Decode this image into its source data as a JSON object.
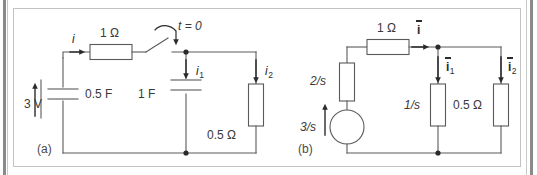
{
  "figure": {
    "type": "circuit-diagram",
    "background_color": "#ffffff",
    "line_color": "#4a4a4a",
    "panels": [
      {
        "id": "a",
        "caption": "(a)",
        "components": [
          {
            "name": "source-3v",
            "label": "3 V",
            "kind": "voltage-source-arrow"
          },
          {
            "name": "resistor-1ohm",
            "label": "1 Ω",
            "kind": "resistor"
          },
          {
            "name": "capacitor-0p5f",
            "label": "0.5 F",
            "kind": "capacitor"
          },
          {
            "name": "capacitor-1f",
            "label": "1 F",
            "kind": "capacitor"
          },
          {
            "name": "resistor-0p5ohm",
            "label": "0.5 Ω",
            "kind": "resistor"
          },
          {
            "name": "switch",
            "label": "t = 0",
            "kind": "switch"
          }
        ],
        "currents": [
          {
            "name": "current-i",
            "base": "i",
            "sub": "",
            "bar": false
          },
          {
            "name": "current-i1",
            "base": "i",
            "sub": "1",
            "bar": false
          },
          {
            "name": "current-i2",
            "base": "i",
            "sub": "2",
            "bar": false
          }
        ]
      },
      {
        "id": "b",
        "caption": "(b)",
        "components": [
          {
            "name": "source-3-over-s",
            "label": "3/s",
            "kind": "voltage-source-circle"
          },
          {
            "name": "impedance-2-over-s",
            "label": "2/s",
            "kind": "impedance"
          },
          {
            "name": "impedance-1ohm",
            "label": "1 Ω",
            "kind": "impedance"
          },
          {
            "name": "impedance-1-over-s",
            "label": "1/s",
            "kind": "impedance"
          },
          {
            "name": "impedance-0p5ohm",
            "label": "0.5 Ω",
            "kind": "impedance"
          }
        ],
        "currents": [
          {
            "name": "current-i-bar",
            "base": "i",
            "sub": "",
            "bar": true
          },
          {
            "name": "current-i1-bar",
            "base": "i",
            "sub": "1",
            "bar": true
          },
          {
            "name": "current-i2-bar",
            "base": "i",
            "sub": "2",
            "bar": true
          }
        ]
      }
    ]
  }
}
